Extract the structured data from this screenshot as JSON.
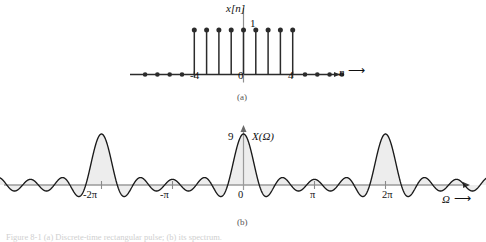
{
  "figure": {
    "panel_a_tag": "(a)",
    "panel_b_tag": "(b)",
    "caption": "Figure  8-1  (a) Discrete-time rectangular pulse; (b) its spectrum."
  },
  "panel_a": {
    "signal_label": "x[n]",
    "amplitude_label": "1",
    "axis_label": "n",
    "axis_arrow": "⟶",
    "xticks": [
      "-4",
      "0",
      "4"
    ],
    "stem_dots_left": 4,
    "stem_dots_right": 4
  },
  "panel_b": {
    "spectrum_label": "X(Ω)",
    "peak_label": "9",
    "axis_label": "Ω",
    "axis_arrow": "⟶",
    "xticks": [
      "-2π",
      "-π",
      "0",
      "π",
      "2π"
    ]
  },
  "colors": {
    "curve": "#1a1a1a",
    "fill": "#ededed",
    "axis": "#9a9a9a",
    "stem": "#2b2b2b"
  },
  "chart_data": [
    {
      "type": "stem",
      "title": "x[n]",
      "xlabel": "n",
      "ylabel": "x[n]",
      "x": [
        -4,
        -3,
        -2,
        -1,
        0,
        1,
        2,
        3,
        4
      ],
      "values": [
        1,
        1,
        1,
        1,
        1,
        1,
        1,
        1,
        1
      ],
      "zero_samples_x": [
        -8,
        -7,
        -6,
        -5,
        5,
        6,
        7,
        8
      ],
      "zero_samples_values": [
        0,
        0,
        0,
        0,
        0,
        0,
        0,
        0
      ],
      "xticks": [
        -4,
        0,
        4
      ],
      "xticklabels": [
        "-4",
        "0",
        "4"
      ],
      "yticks": [
        1
      ],
      "yticklabels": [
        "1"
      ],
      "ylim": [
        0,
        1.25
      ],
      "xlim": [
        -9.5,
        11
      ],
      "grid": false,
      "legend": false
    },
    {
      "type": "line",
      "title": "X(Ω)",
      "xlabel": "Ω",
      "ylabel": "X(Ω)",
      "function": "Dirichlet kernel: X(Ω)=sin(4.5Ω)/sin(0.5Ω)",
      "N": 9,
      "period": 6.283185307,
      "peak_value": 9,
      "peak_locations": [
        -6.283185307,
        0,
        6.283185307
      ],
      "zero_crossings_per_period": 8,
      "xticks": [
        -6.283185307,
        -3.141592653,
        0,
        3.141592653,
        6.283185307
      ],
      "xticklabels": [
        "-2π",
        "-π",
        "0",
        "π",
        "2π"
      ],
      "yticks": [
        9
      ],
      "yticklabels": [
        "9"
      ],
      "ylim": [
        -2.2,
        9.6
      ],
      "xlim": [
        -11.0,
        11.6
      ],
      "grid": false,
      "legend": false,
      "fill_under_curve": true,
      "sidelobe_peak_approx": [
        1.4,
        0.9,
        0.75
      ]
    }
  ]
}
